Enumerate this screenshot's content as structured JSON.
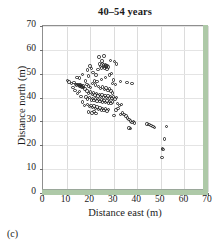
{
  "caption": "(c)",
  "chart_data": {
    "type": "scatter",
    "title": "40–54 years",
    "xlabel": "Distance east (m)",
    "ylabel": "Distance north (m)",
    "xlim": [
      0,
      70
    ],
    "ylim": [
      0,
      70
    ],
    "xticks": [
      0,
      10,
      20,
      30,
      40,
      50,
      60,
      70
    ],
    "yticks": [
      0,
      10,
      20,
      30,
      40,
      50,
      60,
      70
    ],
    "grid": true,
    "legend": null,
    "marker": "open-circle",
    "marker_color": "#2a2a2a",
    "accent_color": "#aec9a8",
    "points": [
      [
        10.4,
        47.2
      ],
      [
        11.0,
        46.6
      ],
      [
        12.2,
        46.0
      ],
      [
        13.1,
        46.4
      ],
      [
        13.8,
        45.6
      ],
      [
        14.2,
        45.2
      ],
      [
        14.6,
        45.6
      ],
      [
        15.0,
        45.0
      ],
      [
        15.3,
        45.4
      ],
      [
        15.6,
        44.8
      ],
      [
        15.8,
        45.2
      ],
      [
        16.1,
        44.6
      ],
      [
        16.4,
        45.0
      ],
      [
        16.6,
        44.4
      ],
      [
        16.9,
        44.8
      ],
      [
        17.2,
        44.2
      ],
      [
        14.4,
        48.4
      ],
      [
        15.6,
        48.2
      ],
      [
        16.8,
        49.6
      ],
      [
        18.0,
        47.0
      ],
      [
        18.8,
        51.6
      ],
      [
        19.4,
        49.0
      ],
      [
        19.9,
        53.2
      ],
      [
        20.6,
        52.2
      ],
      [
        21.2,
        50.6
      ],
      [
        21.8,
        47.0
      ],
      [
        22.4,
        49.4
      ],
      [
        22.9,
        46.8
      ],
      [
        23.4,
        51.8
      ],
      [
        23.9,
        54.0
      ],
      [
        24.3,
        53.0
      ],
      [
        24.7,
        52.4
      ],
      [
        25.0,
        55.4
      ],
      [
        25.3,
        54.4
      ],
      [
        25.6,
        53.6
      ],
      [
        25.9,
        53.0
      ],
      [
        26.1,
        52.4
      ],
      [
        26.4,
        53.8
      ],
      [
        26.7,
        53.2
      ],
      [
        26.9,
        52.6
      ],
      [
        27.2,
        52.0
      ],
      [
        27.4,
        53.4
      ],
      [
        27.7,
        52.8
      ],
      [
        25.8,
        57.4
      ],
      [
        23.8,
        57.0
      ],
      [
        28.6,
        55.6
      ],
      [
        30.4,
        55.2
      ],
      [
        31.2,
        54.0
      ],
      [
        29.0,
        50.2
      ],
      [
        30.0,
        47.4
      ],
      [
        32.8,
        46.8
      ],
      [
        35.6,
        46.2
      ],
      [
        37.8,
        45.8
      ],
      [
        28.2,
        49.4
      ],
      [
        26.4,
        48.4
      ],
      [
        24.8,
        47.6
      ],
      [
        23.6,
        44.6
      ],
      [
        24.4,
        43.8
      ],
      [
        25.2,
        44.4
      ],
      [
        26.0,
        43.4
      ],
      [
        26.8,
        44.0
      ],
      [
        27.6,
        43.0
      ],
      [
        28.2,
        43.6
      ],
      [
        28.8,
        42.8
      ],
      [
        29.4,
        42.0
      ],
      [
        18.6,
        42.8
      ],
      [
        19.4,
        41.8
      ],
      [
        20.2,
        42.4
      ],
      [
        20.9,
        41.4
      ],
      [
        21.5,
        42.0
      ],
      [
        22.1,
        41.0
      ],
      [
        22.7,
        41.6
      ],
      [
        23.3,
        40.6
      ],
      [
        23.9,
        41.2
      ],
      [
        24.5,
        40.4
      ],
      [
        25.1,
        41.0
      ],
      [
        25.7,
        40.2
      ],
      [
        26.3,
        40.8
      ],
      [
        26.9,
        40.0
      ],
      [
        27.5,
        40.6
      ],
      [
        28.1,
        39.8
      ],
      [
        28.7,
        40.4
      ],
      [
        29.3,
        39.6
      ],
      [
        29.9,
        40.2
      ],
      [
        30.5,
        39.4
      ],
      [
        31.1,
        40.0
      ],
      [
        18.2,
        40.2
      ],
      [
        19.0,
        39.4
      ],
      [
        19.8,
        40.0
      ],
      [
        20.5,
        39.0
      ],
      [
        21.1,
        39.6
      ],
      [
        21.7,
        38.8
      ],
      [
        22.3,
        39.4
      ],
      [
        22.9,
        38.6
      ],
      [
        23.5,
        39.2
      ],
      [
        24.1,
        38.4
      ],
      [
        24.7,
        39.0
      ],
      [
        25.3,
        38.2
      ],
      [
        25.9,
        38.8
      ],
      [
        26.5,
        38.0
      ],
      [
        27.1,
        38.6
      ],
      [
        27.7,
        37.8
      ],
      [
        28.3,
        38.4
      ],
      [
        28.9,
        37.6
      ],
      [
        29.5,
        38.2
      ],
      [
        18.8,
        37.0
      ],
      [
        19.6,
        36.2
      ],
      [
        20.4,
        36.8
      ],
      [
        21.1,
        35.8
      ],
      [
        21.7,
        36.4
      ],
      [
        22.3,
        35.4
      ],
      [
        22.9,
        36.0
      ],
      [
        23.5,
        35.0
      ],
      [
        24.1,
        35.6
      ],
      [
        24.7,
        34.8
      ],
      [
        25.3,
        35.4
      ],
      [
        25.9,
        34.6
      ],
      [
        26.5,
        35.2
      ],
      [
        27.1,
        34.4
      ],
      [
        27.7,
        35.0
      ],
      [
        20.8,
        33.6
      ],
      [
        21.6,
        34.2
      ],
      [
        22.4,
        33.4
      ],
      [
        19.2,
        34.0
      ],
      [
        17.6,
        36.6
      ],
      [
        16.8,
        38.2
      ],
      [
        16.2,
        40.4
      ],
      [
        15.4,
        42.6
      ],
      [
        14.6,
        41.8
      ],
      [
        31.6,
        37.4
      ],
      [
        32.4,
        36.6
      ],
      [
        33.2,
        37.2
      ],
      [
        31.0,
        34.8
      ],
      [
        31.8,
        35.4
      ],
      [
        30.2,
        32.4
      ],
      [
        32.8,
        33.0
      ],
      [
        33.6,
        33.6
      ],
      [
        34.4,
        33.0
      ],
      [
        35.2,
        32.2
      ],
      [
        35.9,
        31.4
      ],
      [
        36.5,
        30.8
      ],
      [
        37.1,
        30.2
      ],
      [
        37.7,
        29.6
      ],
      [
        38.3,
        30.0
      ],
      [
        38.9,
        29.4
      ],
      [
        36.4,
        27.2
      ],
      [
        37.0,
        27.0
      ],
      [
        44.2,
        29.0
      ],
      [
        45.0,
        28.6
      ],
      [
        45.8,
        28.2
      ],
      [
        46.6,
        28.0
      ],
      [
        47.4,
        27.4
      ],
      [
        52.4,
        27.8
      ],
      [
        51.6,
        22.6
      ],
      [
        50.8,
        18.6
      ],
      [
        50.9,
        18.2
      ],
      [
        50.4,
        15.0
      ],
      [
        30.8,
        45.6
      ],
      [
        29.6,
        46.0
      ],
      [
        13.6,
        43.0
      ],
      [
        12.8,
        44.2
      ],
      [
        21.0,
        45.8
      ],
      [
        22.2,
        45.2
      ],
      [
        20.2,
        44.2
      ],
      [
        19.4,
        44.8
      ],
      [
        18.6,
        45.4
      ],
      [
        17.8,
        43.6
      ]
    ]
  }
}
